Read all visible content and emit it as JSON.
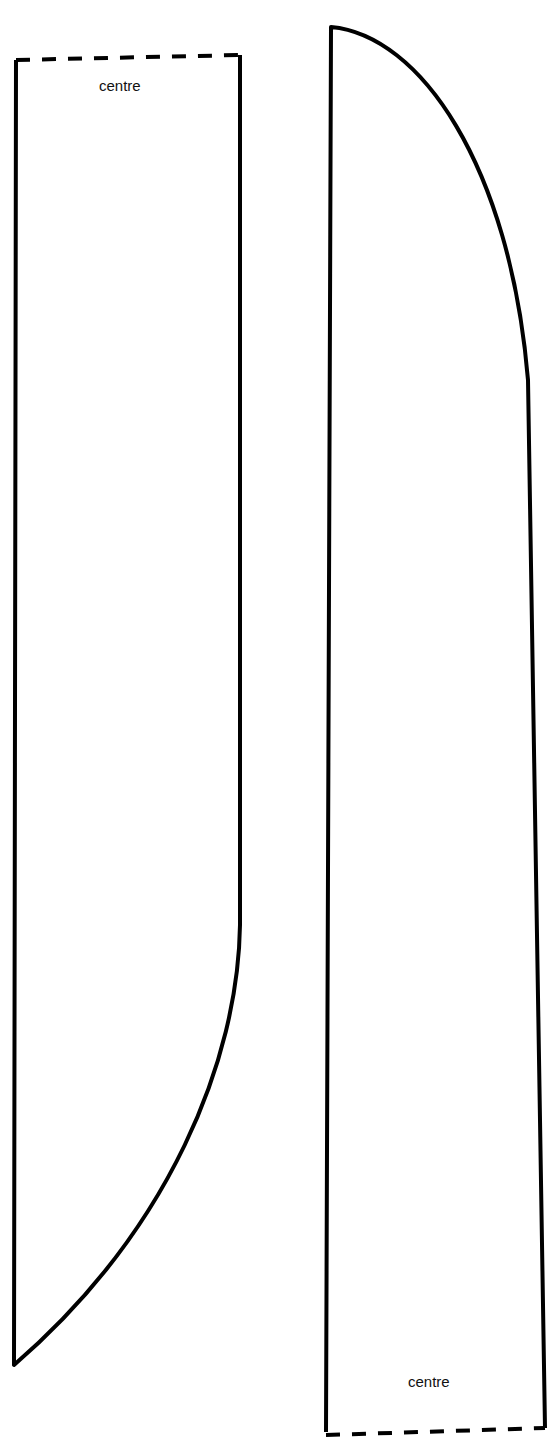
{
  "diagram": {
    "type": "sewing-pattern-pieces",
    "line_color": "#000000",
    "background": "#ffffff",
    "pieces": [
      {
        "id": "left-piece",
        "fold_edge_label": "centre",
        "fold_edge_position": "top",
        "curved_edge": "bottom-right"
      },
      {
        "id": "right-piece",
        "fold_edge_label": "centre",
        "fold_edge_position": "bottom",
        "curved_edge": "top-right"
      }
    ]
  }
}
